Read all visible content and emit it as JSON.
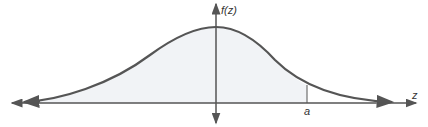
{
  "diagram": {
    "y_axis_label": "f(z)",
    "x_axis_label": "z",
    "marker_label": "a",
    "colors": {
      "curve": "#555555",
      "axis": "#555555",
      "shade": "#f1f3f6"
    }
  }
}
